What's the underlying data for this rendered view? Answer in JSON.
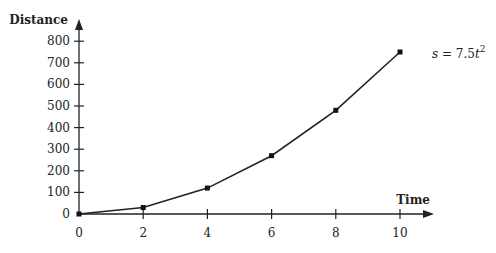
{
  "chart_data": {
    "type": "line",
    "title": "",
    "xlabel": "Time",
    "ylabel": "Distance",
    "x": [
      0,
      2,
      4,
      6,
      8,
      10
    ],
    "series": [
      {
        "name": "s = 7.5t^2",
        "values": [
          0,
          30,
          120,
          270,
          480,
          750
        ]
      }
    ],
    "xticks": [
      "0",
      "2",
      "4",
      "6",
      "8",
      "10"
    ],
    "yticks": [
      "0",
      "100",
      "200",
      "300",
      "400",
      "500",
      "600",
      "700",
      "800"
    ],
    "xlim": [
      0,
      11
    ],
    "ylim": [
      0,
      850
    ],
    "grid": false,
    "annotation": {
      "prefix": "s = 7.5",
      "var": "t",
      "exp": "2"
    }
  }
}
